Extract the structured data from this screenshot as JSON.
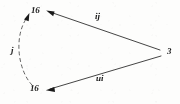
{
  "figure": {
    "type": "directed-graph-diagram",
    "width": 180,
    "height": 104,
    "background_color": "#fdfdfc",
    "ink_color": "#1a1a1a",
    "nodes": [
      {
        "id": "top-left",
        "label": "16",
        "x": 38,
        "y": 11,
        "label_x": 31,
        "label_y": 6
      },
      {
        "id": "bottom-left",
        "label": "16",
        "x": 37,
        "y": 89,
        "label_x": 30,
        "label_y": 84
      },
      {
        "id": "right",
        "label": "3",
        "x": 166,
        "y": 52,
        "label_x": 167,
        "label_y": 47
      }
    ],
    "edges": [
      {
        "id": "edge-top",
        "from": "right",
        "to": "top-left",
        "style": "solid",
        "arrow_at": "to",
        "label": "ij",
        "label_x": 95,
        "label_y": 12
      },
      {
        "id": "edge-bottom",
        "from": "right",
        "to": "bottom-left",
        "style": "solid",
        "arrow_at": "to",
        "label": "ui",
        "label_x": 96,
        "label_y": 74
      },
      {
        "id": "edge-left-dashed",
        "from": "bottom-left",
        "to": "top-left",
        "style": "dashed",
        "arrow_at": "to",
        "label": "j",
        "label_x": 11,
        "label_y": 46
      }
    ]
  }
}
